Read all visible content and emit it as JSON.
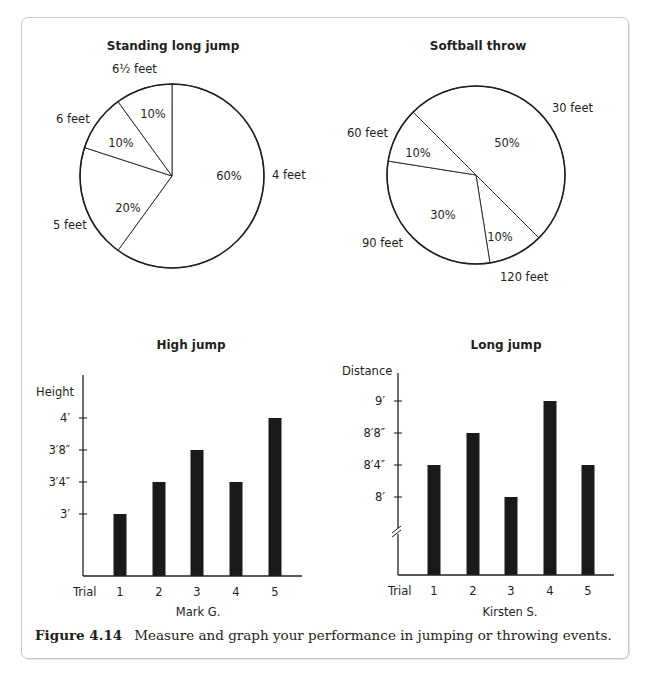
{
  "figure": {
    "label": "Figure 4.14",
    "caption": "Measure and graph your performance in jumping or throwing events."
  },
  "chart_data": [
    {
      "type": "pie",
      "title": "Standing long jump",
      "slices": [
        {
          "label": "4 feet",
          "value": 60,
          "pct_label": "60%"
        },
        {
          "label": "5 feet",
          "value": 20,
          "pct_label": "20%"
        },
        {
          "label": "6 feet",
          "value": 10,
          "pct_label": "10%"
        },
        {
          "label": "6½ feet",
          "value": 10,
          "pct_label": "10%"
        }
      ],
      "start_angle_deg": 0,
      "direction": "clockwise"
    },
    {
      "type": "pie",
      "title": "Softball throw",
      "slices": [
        {
          "label": "30 feet",
          "value": 50,
          "pct_label": "50%"
        },
        {
          "label": "120 feet",
          "value": 10,
          "pct_label": "10%"
        },
        {
          "label": "90 feet",
          "value": 30,
          "pct_label": "30%"
        },
        {
          "label": "60 feet",
          "value": 10,
          "pct_label": "10%"
        }
      ],
      "start_angle_deg": -45,
      "direction": "clockwise"
    },
    {
      "type": "bar",
      "title": "High jump",
      "ylabel": "Height",
      "xlabel": "Mark G.",
      "x_axis_prefix": "Trial",
      "categories": [
        "1",
        "2",
        "3",
        "4",
        "5"
      ],
      "values_inches": [
        36,
        40,
        44,
        40,
        48
      ],
      "value_labels": [
        "3′",
        "3′4″",
        "3′8″",
        "3′4″",
        "4′"
      ],
      "yticks": [
        {
          "value": 36,
          "label": "3′"
        },
        {
          "value": 40,
          "label": "3′4″"
        },
        {
          "value": 44,
          "label": "3′8″"
        },
        {
          "value": 48,
          "label": "4′"
        }
      ],
      "axis_break": false
    },
    {
      "type": "bar",
      "title": "Long jump",
      "ylabel": "Distance",
      "xlabel": "Kirsten S.",
      "x_axis_prefix": "Trial",
      "categories": [
        "1",
        "2",
        "3",
        "4",
        "5"
      ],
      "values_inches": [
        100,
        104,
        96,
        108,
        100
      ],
      "value_labels": [
        "8′4″",
        "8′8″",
        "8′",
        "9′",
        "8′4″"
      ],
      "yticks": [
        {
          "value": 96,
          "label": "8′"
        },
        {
          "value": 100,
          "label": "8′4″"
        },
        {
          "value": 104,
          "label": "8′8″"
        },
        {
          "value": 108,
          "label": "9′"
        }
      ],
      "axis_break": true
    }
  ]
}
